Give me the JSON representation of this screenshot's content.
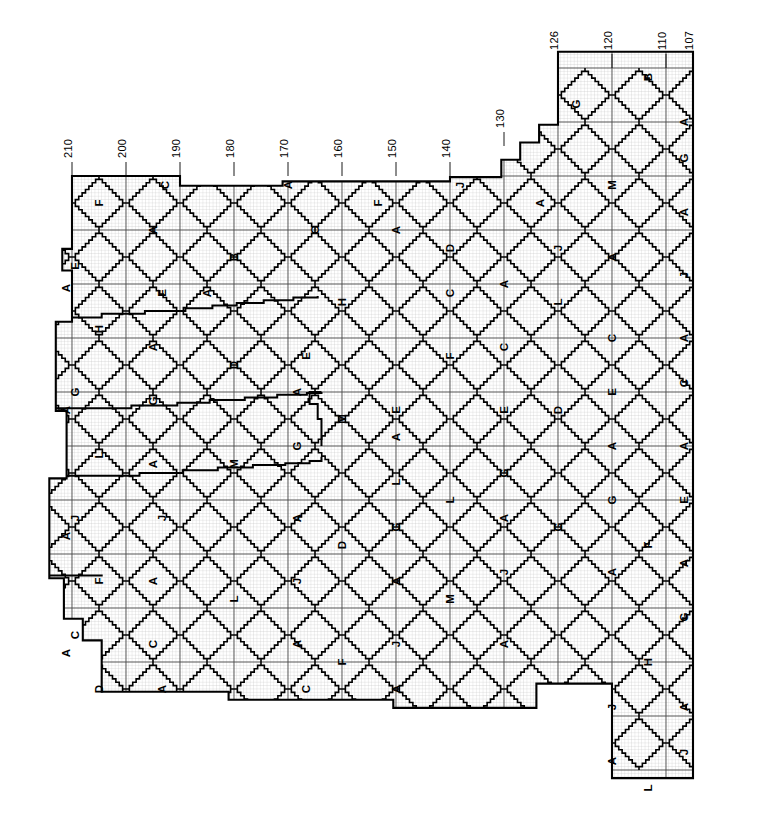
{
  "figure": {
    "kind": "survey-grid-map",
    "orientation_note": "rotated-90-clockwise",
    "background_color": "#ffffff",
    "line_color": "#000000",
    "grid_fine_color": "#b4b4b4",
    "grid_major_color": "#555555",
    "boundary_color": "#000000"
  },
  "axis": {
    "position": "top",
    "tick_labels": [
      "210",
      "200",
      "190",
      "180",
      "170",
      "160",
      "150",
      "140",
      "130",
      "126",
      "120",
      "110",
      "107"
    ],
    "ticks": [
      {
        "label": "210",
        "x": 72
      },
      {
        "label": "200",
        "x": 126
      },
      {
        "label": "190",
        "x": 180
      },
      {
        "label": "180",
        "x": 234
      },
      {
        "label": "170",
        "x": 288
      },
      {
        "label": "160",
        "x": 342
      },
      {
        "label": "150",
        "x": 396
      },
      {
        "label": "140",
        "x": 450
      },
      {
        "label": "130",
        "x": 504
      },
      {
        "label": "126",
        "x": 558
      },
      {
        "label": "120",
        "x": 612
      },
      {
        "label": "110",
        "x": 666
      },
      {
        "label": "107",
        "x": 693
      }
    ]
  },
  "geometry": {
    "cell": 54,
    "fine": 3.375,
    "origin_x": 72,
    "origin_y": 176,
    "cols": 12,
    "rows": 10,
    "dashed_right_edge_x": 693
  },
  "regions": [
    {
      "label": "F",
      "x": 99,
      "y": 203,
      "type": "corner"
    },
    {
      "label": "C",
      "x": 165,
      "y": 185,
      "type": "corner"
    },
    {
      "label": "A",
      "x": 153,
      "y": 230,
      "type": "triangle"
    },
    {
      "label": "B",
      "x": 234,
      "y": 257,
      "type": "diamond"
    },
    {
      "label": "A",
      "x": 288,
      "y": 185,
      "type": "triangle"
    },
    {
      "label": "C",
      "x": 315,
      "y": 230,
      "type": "triangle"
    },
    {
      "label": "F",
      "x": 378,
      "y": 203,
      "type": "triangle"
    },
    {
      "label": "A",
      "x": 396,
      "y": 230,
      "type": "triangle"
    },
    {
      "label": "J",
      "x": 460,
      "y": 185,
      "type": "triangle"
    },
    {
      "label": "D",
      "x": 450,
      "y": 248,
      "type": "diamond"
    },
    {
      "label": "A",
      "x": 540,
      "y": 203,
      "type": "triangle"
    },
    {
      "label": "J",
      "x": 558,
      "y": 248,
      "type": "triangle"
    },
    {
      "label": "M",
      "x": 612,
      "y": 185,
      "type": "diamond"
    },
    {
      "label": "G",
      "x": 576,
      "y": 104,
      "type": "triangle"
    },
    {
      "label": "B",
      "x": 648,
      "y": 77,
      "type": "triangle"
    },
    {
      "label": "A",
      "x": 684,
      "y": 122,
      "type": "triangle"
    },
    {
      "label": "G",
      "x": 684,
      "y": 158,
      "type": "triangle"
    },
    {
      "label": "A",
      "x": 684,
      "y": 212,
      "type": "triangle"
    },
    {
      "label": "J",
      "x": 684,
      "y": 275,
      "type": "triangle"
    },
    {
      "label": "A",
      "x": 684,
      "y": 338,
      "type": "triangle"
    },
    {
      "label": "C",
      "x": 684,
      "y": 383,
      "type": "triangle"
    },
    {
      "label": "A",
      "x": 684,
      "y": 446,
      "type": "triangle"
    },
    {
      "label": "E",
      "x": 684,
      "y": 500,
      "type": "triangle"
    },
    {
      "label": "A",
      "x": 684,
      "y": 563,
      "type": "triangle"
    },
    {
      "label": "G",
      "x": 684,
      "y": 617,
      "type": "triangle"
    },
    {
      "label": "A",
      "x": 684,
      "y": 707,
      "type": "triangle"
    },
    {
      "label": "J",
      "x": 684,
      "y": 752,
      "type": "triangle"
    },
    {
      "label": "E",
      "x": 75,
      "y": 266,
      "type": "sliver"
    },
    {
      "label": "A",
      "x": 66,
      "y": 288,
      "type": "sliver"
    },
    {
      "label": "H",
      "x": 99,
      "y": 329,
      "type": "diamond"
    },
    {
      "label": "G",
      "x": 75,
      "y": 392,
      "type": "sliver"
    },
    {
      "label": "A",
      "x": 66,
      "y": 410,
      "type": "sliver"
    },
    {
      "label": "L",
      "x": 99,
      "y": 455,
      "type": "diamond"
    },
    {
      "label": "J",
      "x": 75,
      "y": 518,
      "type": "sliver"
    },
    {
      "label": "A",
      "x": 66,
      "y": 536,
      "type": "sliver"
    },
    {
      "label": "F",
      "x": 99,
      "y": 581,
      "type": "diamond"
    },
    {
      "label": "C",
      "x": 75,
      "y": 635,
      "type": "sliver"
    },
    {
      "label": "A",
      "x": 66,
      "y": 653,
      "type": "sliver"
    },
    {
      "label": "D",
      "x": 99,
      "y": 689,
      "type": "triangle"
    },
    {
      "label": "E",
      "x": 162,
      "y": 293,
      "type": "triangle"
    },
    {
      "label": "A",
      "x": 153,
      "y": 347,
      "type": "triangle"
    },
    {
      "label": "G",
      "x": 153,
      "y": 401,
      "type": "triangle"
    },
    {
      "label": "A",
      "x": 153,
      "y": 464,
      "type": "triangle"
    },
    {
      "label": "J",
      "x": 162,
      "y": 518,
      "type": "triangle"
    },
    {
      "label": "A",
      "x": 153,
      "y": 581,
      "type": "triangle"
    },
    {
      "label": "C",
      "x": 153,
      "y": 644,
      "type": "triangle"
    },
    {
      "label": "A",
      "x": 162,
      "y": 689,
      "type": "triangle"
    },
    {
      "label": "A",
      "x": 207,
      "y": 293,
      "type": "triangle"
    },
    {
      "label": "D",
      "x": 234,
      "y": 365,
      "type": "diamond"
    },
    {
      "label": "M",
      "x": 234,
      "y": 464,
      "type": "diamond"
    },
    {
      "label": "L",
      "x": 234,
      "y": 599,
      "type": "diamond"
    },
    {
      "label": "E",
      "x": 306,
      "y": 356,
      "type": "triangle"
    },
    {
      "label": "A",
      "x": 297,
      "y": 392,
      "type": "triangle"
    },
    {
      "label": "G",
      "x": 297,
      "y": 446,
      "type": "triangle"
    },
    {
      "label": "A",
      "x": 297,
      "y": 518,
      "type": "triangle"
    },
    {
      "label": "J",
      "x": 297,
      "y": 581,
      "type": "triangle"
    },
    {
      "label": "A",
      "x": 297,
      "y": 644,
      "type": "triangle"
    },
    {
      "label": "C",
      "x": 306,
      "y": 689,
      "type": "triangle"
    },
    {
      "label": "H",
      "x": 342,
      "y": 302,
      "type": "diamond"
    },
    {
      "label": "M",
      "x": 342,
      "y": 419,
      "type": "diamond"
    },
    {
      "label": "D",
      "x": 342,
      "y": 545,
      "type": "diamond"
    },
    {
      "label": "F",
      "x": 342,
      "y": 662,
      "type": "triangle"
    },
    {
      "label": "E",
      "x": 396,
      "y": 410,
      "type": "triangle"
    },
    {
      "label": "A",
      "x": 396,
      "y": 437,
      "type": "triangle"
    },
    {
      "label": "L",
      "x": 396,
      "y": 482,
      "type": "triangle"
    },
    {
      "label": "G",
      "x": 396,
      "y": 527,
      "type": "triangle"
    },
    {
      "label": "A",
      "x": 396,
      "y": 581,
      "type": "triangle"
    },
    {
      "label": "J",
      "x": 396,
      "y": 644,
      "type": "triangle"
    },
    {
      "label": "A",
      "x": 396,
      "y": 689,
      "type": "triangle"
    },
    {
      "label": "C",
      "x": 450,
      "y": 293,
      "type": "triangle"
    },
    {
      "label": "F",
      "x": 450,
      "y": 356,
      "type": "diamond"
    },
    {
      "label": "L",
      "x": 450,
      "y": 500,
      "type": "diamond"
    },
    {
      "label": "M",
      "x": 450,
      "y": 599,
      "type": "diamond"
    },
    {
      "label": "A",
      "x": 504,
      "y": 284,
      "type": "triangle"
    },
    {
      "label": "C",
      "x": 504,
      "y": 347,
      "type": "triangle"
    },
    {
      "label": "E",
      "x": 504,
      "y": 410,
      "type": "triangle"
    },
    {
      "label": "G",
      "x": 504,
      "y": 473,
      "type": "triangle"
    },
    {
      "label": "A",
      "x": 504,
      "y": 518,
      "type": "triangle"
    },
    {
      "label": "J",
      "x": 504,
      "y": 572,
      "type": "triangle"
    },
    {
      "label": "A",
      "x": 504,
      "y": 644,
      "type": "triangle"
    },
    {
      "label": "L",
      "x": 558,
      "y": 302,
      "type": "diamond"
    },
    {
      "label": "D",
      "x": 558,
      "y": 410,
      "type": "diamond"
    },
    {
      "label": "G",
      "x": 558,
      "y": 527,
      "type": "diamond"
    },
    {
      "label": "A",
      "x": 612,
      "y": 257,
      "type": "triangle"
    },
    {
      "label": "C",
      "x": 612,
      "y": 338,
      "type": "triangle"
    },
    {
      "label": "E",
      "x": 612,
      "y": 392,
      "type": "triangle"
    },
    {
      "label": "A",
      "x": 612,
      "y": 446,
      "type": "triangle"
    },
    {
      "label": "G",
      "x": 612,
      "y": 500,
      "type": "triangle"
    },
    {
      "label": "A",
      "x": 612,
      "y": 572,
      "type": "triangle"
    },
    {
      "label": "J",
      "x": 612,
      "y": 707,
      "type": "triangle"
    },
    {
      "label": "F",
      "x": 648,
      "y": 545,
      "type": "diamond"
    },
    {
      "label": "H",
      "x": 648,
      "y": 662,
      "type": "diamond"
    },
    {
      "label": "A",
      "x": 612,
      "y": 761,
      "type": "triangle"
    },
    {
      "label": "L",
      "x": 648,
      "y": 788,
      "type": "triangle"
    }
  ]
}
